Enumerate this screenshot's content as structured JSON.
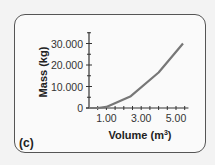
{
  "figure": {
    "panel_label": "(c)",
    "y_axis_label": "Mass (kg)",
    "x_axis_label_base": "Volume (m",
    "x_axis_label_sup": "3",
    "x_axis_label_close": ")",
    "y_tick_labels": [
      "0",
      "10.000",
      "20.000",
      "30.000"
    ],
    "x_tick_labels": [
      "1.00",
      "3.00",
      "5.00"
    ]
  },
  "colors": {
    "line": "#777777",
    "axis": "#333333",
    "border": "#555555",
    "background": "#f3f3f3",
    "panel": "#fafafa"
  },
  "chart_data": {
    "type": "line",
    "title": "",
    "xlabel": "Volume (m³)",
    "ylabel": "Mass (kg)",
    "x": [
      0.0,
      0.5,
      1.0,
      2.4,
      4.0,
      5.4
    ],
    "series": [
      {
        "name": "Mass",
        "values": [
          0,
          0,
          500,
          5500,
          16500,
          30000
        ]
      }
    ],
    "xlim": [
      0,
      5.6
    ],
    "ylim": [
      0,
      35000
    ],
    "x_ticks": [
      1.0,
      3.0,
      5.0
    ],
    "x_minor_tick_step": 0.5,
    "y_ticks": [
      0,
      10000,
      20000,
      30000
    ],
    "y_minor_tick_step": 5000,
    "grid": false,
    "legend": null,
    "panel_label": "(c)"
  }
}
